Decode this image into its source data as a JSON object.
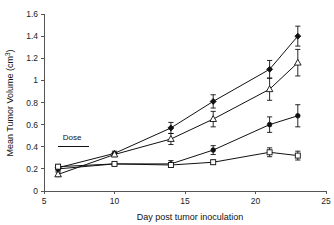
{
  "chart_data": {
    "type": "line",
    "title": "",
    "xlabel": "Day post tumor inoculation",
    "ylabel": "Mean Tumor Volume (cm³)",
    "ylabel_base": "Mean Tumor Volume (cm",
    "ylabel_sup": "3",
    "ylabel_close": ")",
    "xlim": [
      5,
      25
    ],
    "ylim": [
      0,
      1.6
    ],
    "grid": false,
    "legend": "none",
    "xticks": [
      5,
      10,
      15,
      20,
      25
    ],
    "xtick_labels": [
      "5",
      "10",
      "15",
      "20",
      "25"
    ],
    "yticks": [
      0,
      0.2,
      0.4,
      0.6,
      0.8,
      1,
      1.2,
      1.4,
      1.6
    ],
    "ytick_labels": [
      "0",
      "0.2",
      "0.4",
      "0.6",
      "0.8",
      "1",
      "1.2",
      "1.4",
      "1.6"
    ],
    "x": [
      6,
      10,
      14,
      17,
      21,
      23
    ],
    "series": [
      {
        "name": "Series 1",
        "marker": "filled-diamond",
        "values": [
          0.21,
          0.34,
          0.57,
          0.81,
          1.1,
          1.4
        ],
        "errors": [
          0.02,
          0.02,
          0.05,
          0.06,
          0.08,
          0.09
        ]
      },
      {
        "name": "Series 2",
        "marker": "open-triangle",
        "values": [
          0.15,
          0.33,
          0.47,
          0.65,
          0.92,
          1.16
        ],
        "errors": [
          0.02,
          0.02,
          0.05,
          0.07,
          0.1,
          0.12
        ]
      },
      {
        "name": "Series 3",
        "marker": "filled-circle",
        "values": [
          0.2,
          0.245,
          0.245,
          0.37,
          0.6,
          0.68
        ],
        "errors": [
          0.02,
          0.015,
          0.03,
          0.04,
          0.07,
          0.1
        ]
      },
      {
        "name": "Series 4",
        "marker": "open-square",
        "values": [
          0.22,
          0.245,
          0.235,
          0.26,
          0.35,
          0.32
        ],
        "errors": [
          0.02,
          0.015,
          0.02,
          0.02,
          0.04,
          0.04
        ]
      }
    ],
    "annotations": [
      {
        "label": "Dose",
        "label_x": 7.0,
        "label_y": 0.46,
        "rule_x_start": 6.0,
        "rule_x_end": 8.2,
        "rule_y": 0.4
      }
    ]
  }
}
